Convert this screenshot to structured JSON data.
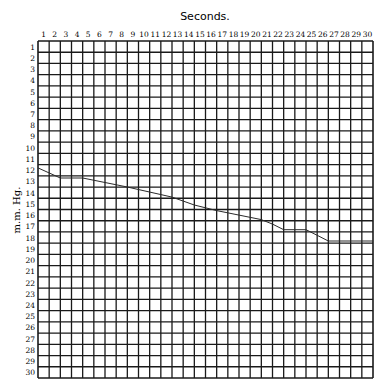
{
  "chart_data": {
    "type": "line",
    "title": "Seconds.",
    "xlabel": "Seconds.",
    "ylabel": "m.m. Hg.",
    "x_ticks": [
      1,
      2,
      3,
      4,
      5,
      6,
      7,
      8,
      9,
      10,
      11,
      12,
      13,
      14,
      15,
      16,
      17,
      18,
      19,
      20,
      21,
      22,
      23,
      24,
      25,
      26,
      27,
      28,
      29,
      30
    ],
    "y_ticks": [
      1,
      2,
      3,
      4,
      5,
      6,
      7,
      8,
      9,
      10,
      11,
      12,
      13,
      14,
      15,
      16,
      17,
      18,
      19,
      20,
      21,
      22,
      23,
      24,
      25,
      26,
      27,
      28,
      29,
      30
    ],
    "grid": true,
    "xlim": [
      0,
      30
    ],
    "ylim": [
      0,
      30
    ],
    "y_inverted": true,
    "series": [
      {
        "name": "pressure trace",
        "points": [
          [
            0,
            11.3
          ],
          [
            2,
            12.2
          ],
          [
            4,
            12.2
          ],
          [
            8,
            13.0
          ],
          [
            12,
            13.9
          ],
          [
            14,
            14.6
          ],
          [
            16,
            15.1
          ],
          [
            18,
            15.5
          ],
          [
            20,
            15.9
          ],
          [
            21,
            16.3
          ],
          [
            22,
            16.8
          ],
          [
            24,
            16.8
          ],
          [
            25,
            17.3
          ],
          [
            26,
            17.8
          ],
          [
            30,
            17.8
          ]
        ]
      }
    ],
    "colors": {
      "grid": "#1a1a1a",
      "line": "#2a2a2a",
      "background": "#ffffff"
    }
  }
}
